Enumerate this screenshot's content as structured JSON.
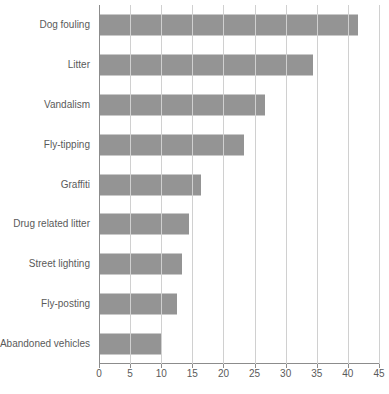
{
  "chart_data": {
    "type": "bar",
    "orientation": "horizontal",
    "title": "",
    "subtitle": "",
    "xlabel": "",
    "ylabel": "",
    "xlim": [
      0,
      45
    ],
    "ylim": null,
    "grid": true,
    "legend": false,
    "legend_position": "none",
    "bar_color": "#949494",
    "gridline_color": "#d0d0d0",
    "axis_color": "#8c8c8c",
    "label_color": "#5a5a5a",
    "xticks": [
      0,
      5,
      10,
      15,
      20,
      25,
      30,
      35,
      40,
      45
    ],
    "xtick_labels": [
      "0",
      "5",
      "10",
      "15",
      "20",
      "25",
      "30",
      "35",
      "40",
      "45"
    ],
    "categories": [
      "Dog fouling",
      "Litter",
      "Vandalism",
      "Fly-tipping",
      "Graffiti",
      "Drug related litter",
      "Street lighting",
      "Fly-posting",
      "Abandoned vehicles"
    ],
    "values": [
      41.5,
      34.3,
      26.5,
      23.2,
      16.3,
      14.3,
      13.2,
      12.3,
      10.0
    ]
  }
}
